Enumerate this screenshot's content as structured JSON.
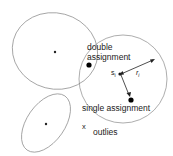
{
  "diagram": {
    "labels": {
      "double_assignment_line1": "double",
      "double_assignment_line2": "assignment",
      "single_assignment": "single assignment",
      "outlier_marker": "x",
      "outlier_label": "outlies",
      "center_label": "s",
      "center_subscript": "i",
      "radius_label": "r",
      "radius_subscript": "i"
    },
    "colors": {
      "outline": "#8a8a8a",
      "point": "#000000",
      "text": "#222222"
    }
  }
}
